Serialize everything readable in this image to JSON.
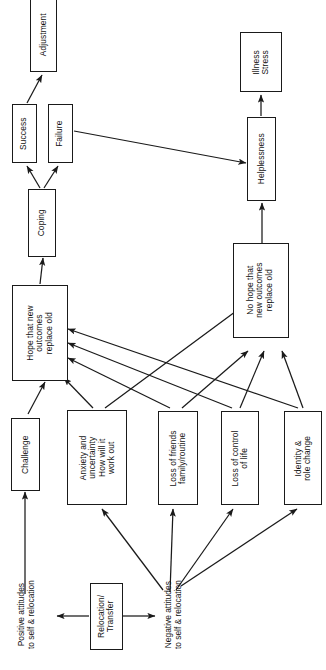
{
  "diagram": {
    "orientation": "rotated-90-counterclockwise",
    "style": {
      "box_stroke": "#1a1a1a",
      "arrow_color": "#1a1a1a",
      "background": "#ffffff"
    },
    "nodes": [
      {
        "id": "adjustment",
        "label": "Adjustment"
      },
      {
        "id": "success",
        "label": "Success"
      },
      {
        "id": "failure",
        "label": "Failure"
      },
      {
        "id": "coping",
        "label": "Coping"
      },
      {
        "id": "hope",
        "label": "Hope that new\noutcomes\nreplace old"
      },
      {
        "id": "challenge",
        "label": "Challenge"
      },
      {
        "id": "anxiety",
        "label": "Anxiety and\nuncertainty\nHow will it\nwork out"
      },
      {
        "id": "lossfriends",
        "label": "Loss of friends\nfamily/routine"
      },
      {
        "id": "losscontrol",
        "label": "Loss of control\nof life"
      },
      {
        "id": "identity",
        "label": "Identity &\nrole change"
      },
      {
        "id": "nohope",
        "label": "No hope that\nnew outcomes\nreplace old"
      },
      {
        "id": "helplessness",
        "label": "Helplessness"
      },
      {
        "id": "illness",
        "label": "Illness\nStress"
      },
      {
        "id": "relocation",
        "label": "Relocation/\nTransfer"
      }
    ],
    "free_labels": [
      {
        "id": "positive-attitudes",
        "label": "Positive attitudes\nto self & relocation"
      },
      {
        "id": "negative-attitudes",
        "label": "Negative attitudes\nto self & relocation"
      }
    ],
    "edges": [
      {
        "from": "relocation",
        "to": "positive-attitudes"
      },
      {
        "from": "relocation",
        "to": "negative-attitudes"
      },
      {
        "from": "positive-attitudes",
        "to": "challenge"
      },
      {
        "from": "negative-attitudes",
        "to": "anxiety"
      },
      {
        "from": "negative-attitudes",
        "to": "lossfriends"
      },
      {
        "from": "negative-attitudes",
        "to": "losscontrol"
      },
      {
        "from": "negative-attitudes",
        "to": "identity"
      },
      {
        "from": "challenge",
        "to": "hope"
      },
      {
        "from": "anxiety",
        "to": "hope"
      },
      {
        "from": "lossfriends",
        "to": "hope"
      },
      {
        "from": "losscontrol",
        "to": "hope"
      },
      {
        "from": "identity",
        "to": "hope"
      },
      {
        "from": "anxiety",
        "to": "nohope"
      },
      {
        "from": "lossfriends",
        "to": "nohope"
      },
      {
        "from": "losscontrol",
        "to": "nohope"
      },
      {
        "from": "identity",
        "to": "nohope"
      },
      {
        "from": "hope",
        "to": "coping"
      },
      {
        "from": "coping",
        "to": "success"
      },
      {
        "from": "coping",
        "to": "failure"
      },
      {
        "from": "success",
        "to": "adjustment"
      },
      {
        "from": "failure",
        "to": "helplessness"
      },
      {
        "from": "nohope",
        "to": "helplessness"
      },
      {
        "from": "helplessness",
        "to": "illness"
      }
    ]
  }
}
